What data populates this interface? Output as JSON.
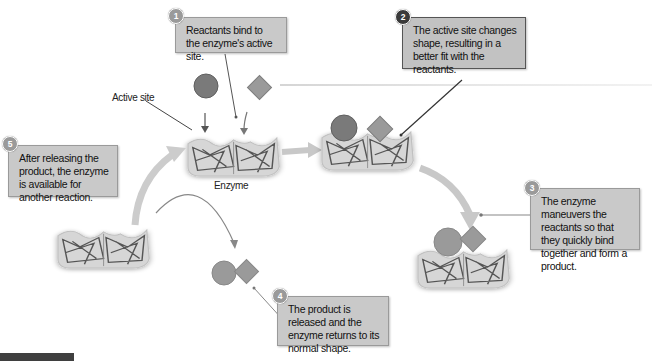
{
  "diagram": {
    "colors": {
      "note_fill": "#c9c9c9",
      "badge_light": "#9a9a9a",
      "badge_dark": "#3a3a3a",
      "enzyme_fill": "#d6d6d6",
      "reactant_circle": "#7a7a7a",
      "reactant_diamond": "#9a9a9a",
      "arrow": "#c8c8c8",
      "footer_bar": "#3f3f3f"
    },
    "labels": {
      "active_site": "Active site",
      "enzyme": "Enzyme"
    },
    "steps": [
      {
        "number": "1",
        "text": "Reactants bind to the enzyme's active site."
      },
      {
        "number": "2",
        "text": "The active site changes shape, resulting in a better fit with the reactants."
      },
      {
        "number": "3",
        "text": "The enzyme maneuvers the reactants so that they quickly bind together and form a product."
      },
      {
        "number": "4",
        "text": "The product is released and the enzyme returns to its normal shape."
      },
      {
        "number": "5",
        "text": "After releasing the product, the enzyme is available for another reaction."
      }
    ]
  }
}
